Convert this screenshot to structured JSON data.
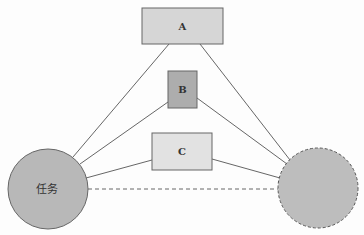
{
  "diagram": {
    "nodes": [
      {
        "id": "A",
        "label": "A",
        "shape": "rect",
        "fill": "#d6d6d6"
      },
      {
        "id": "B",
        "label": "B",
        "shape": "rect",
        "fill": "#adadad"
      },
      {
        "id": "C",
        "label": "C",
        "shape": "rect",
        "fill": "#e2e2e2"
      },
      {
        "id": "task",
        "label": "任务",
        "shape": "circle",
        "fill": "#b8b8b8",
        "border": "solid"
      },
      {
        "id": "goal",
        "label": "",
        "shape": "circle",
        "fill": "#bdbdbd",
        "border": "dashed"
      }
    ],
    "edges": [
      {
        "from": "task",
        "to": "A",
        "style": "solid"
      },
      {
        "from": "task",
        "to": "B",
        "style": "solid"
      },
      {
        "from": "task",
        "to": "C",
        "style": "solid"
      },
      {
        "from": "A",
        "to": "goal",
        "style": "solid"
      },
      {
        "from": "B",
        "to": "goal",
        "style": "solid"
      },
      {
        "from": "C",
        "to": "goal",
        "style": "solid"
      },
      {
        "from": "task",
        "to": "goal",
        "style": "dashed"
      }
    ]
  }
}
